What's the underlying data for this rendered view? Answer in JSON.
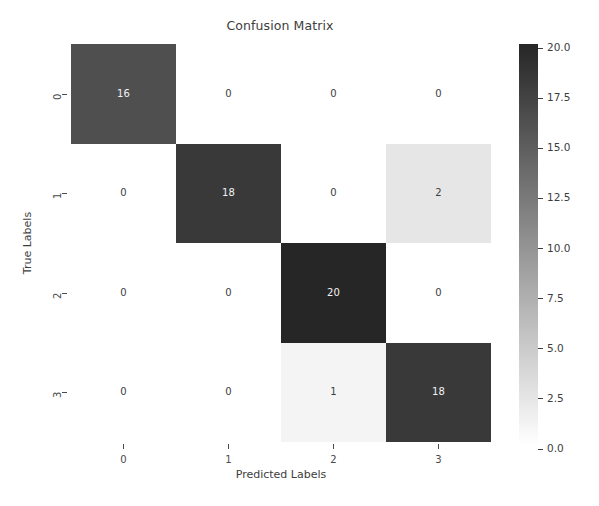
{
  "chart_data": {
    "type": "heatmap",
    "title": "Confusion Matrix",
    "xlabel": "Predicted Labels",
    "ylabel": "True Labels",
    "x_categories": [
      "0",
      "1",
      "2",
      "3"
    ],
    "y_categories": [
      "0",
      "1",
      "2",
      "3"
    ],
    "matrix": [
      [
        16,
        0,
        0,
        0
      ],
      [
        0,
        18,
        0,
        2
      ],
      [
        0,
        0,
        20,
        0
      ],
      [
        0,
        0,
        1,
        18
      ]
    ],
    "cell_labels": [
      [
        "16",
        "0",
        "0",
        "0"
      ],
      [
        "0",
        "18",
        "0",
        "2"
      ],
      [
        "0",
        "0",
        "20",
        "0"
      ],
      [
        "0",
        "0",
        "1",
        "18"
      ]
    ],
    "annotation_colors": [
      [
        "#f2f2f2",
        "#3d3d3d",
        "#3d3d3d",
        "#3d3d3d"
      ],
      [
        "#3d3d3d",
        "#f2f2f2",
        "#3d3d3d",
        "#3d3d3d"
      ],
      [
        "#3d3d3d",
        "#3d3d3d",
        "#f2f2f2",
        "#3d3d3d"
      ],
      [
        "#3d3d3d",
        "#3d3d3d",
        "#3d3d3d",
        "#f2f2f2"
      ]
    ],
    "cell_fills": [
      [
        "#4f4f4f",
        "#ffffff",
        "#ffffff",
        "#ffffff"
      ],
      [
        "#ffffff",
        "#393939",
        "#ffffff",
        "#e6e6e6"
      ],
      [
        "#ffffff",
        "#ffffff",
        "#262626",
        "#ffffff"
      ],
      [
        "#ffffff",
        "#ffffff",
        "#f4f4f4",
        "#393939"
      ]
    ],
    "colormap": "gray_r",
    "colorbar": {
      "tick_labels": [
        "20.0",
        "17.5",
        "15.0",
        "12.5",
        "10.0",
        "7.5",
        "5.0",
        "2.5",
        "0.0"
      ],
      "tick_values": [
        20.0,
        17.5,
        15.0,
        12.5,
        10.0,
        7.5,
        5.0,
        2.5,
        0.0
      ],
      "vmin": 0.0,
      "vmax": 20.0,
      "gradient_top_color": "#262626",
      "gradient_bottom_color": "#ffffff",
      "orientation": "vertical"
    },
    "grid": false,
    "axis_text_color": "#4a4a4a",
    "background_color": "#ffffff"
  }
}
